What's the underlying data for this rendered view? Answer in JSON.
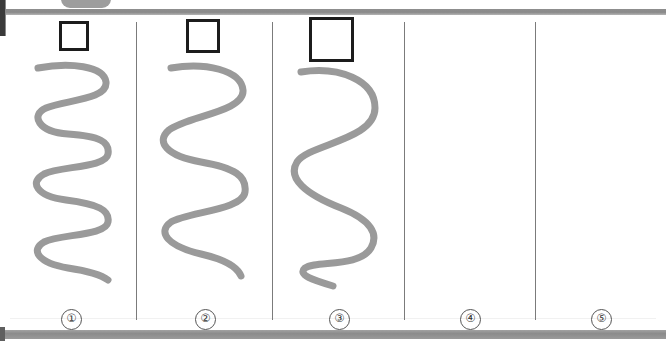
{
  "page": {
    "background_color": "#ffffff",
    "width": 666,
    "height": 344
  },
  "chrome": {
    "top_rule_color": "#8c8c8c",
    "bottom_rule_color": "#929292",
    "tab_nub_color": "#9d9d9d",
    "left_marker_color": "#3a3a3a"
  },
  "columns": [
    {
      "index": 1,
      "label": "①",
      "has_square": true,
      "square": {
        "size": 30,
        "stroke_color": "#1c1c1c"
      },
      "has_curve": true,
      "curve": {
        "waves": 5,
        "color": "#9a9a9a",
        "stroke_width": 7
      }
    },
    {
      "index": 2,
      "label": "②",
      "has_square": true,
      "square": {
        "size": 34,
        "stroke_color": "#1c1c1c"
      },
      "has_curve": true,
      "curve": {
        "waves": 3.5,
        "color": "#9a9a9a",
        "stroke_width": 7
      }
    },
    {
      "index": 3,
      "label": "③",
      "has_square": true,
      "square": {
        "size": 45,
        "stroke_color": "#1c1c1c"
      },
      "has_curve": true,
      "curve": {
        "waves": 2.5,
        "color": "#9a9a9a",
        "stroke_width": 7
      }
    },
    {
      "index": 4,
      "label": "④",
      "has_square": false,
      "has_curve": false
    },
    {
      "index": 5,
      "label": "⑤",
      "has_square": false,
      "has_curve": false
    }
  ]
}
